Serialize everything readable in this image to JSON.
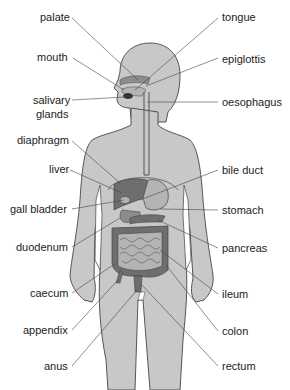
{
  "colors": {
    "body": "#c8c8c8",
    "outline": "#555555",
    "organ_dark": "#6e6e6e",
    "organ_mid": "#8c8c8c",
    "organ_light": "#b4b4b4",
    "leader": "#444444",
    "text": "#222222"
  },
  "labels_left": [
    {
      "id": "palate",
      "text": "palate"
    },
    {
      "id": "mouth",
      "text": "mouth"
    },
    {
      "id": "salivary-glands",
      "text": "salivary",
      "text2": "glands"
    },
    {
      "id": "diaphragm",
      "text": "diaphragm"
    },
    {
      "id": "liver",
      "text": "liver"
    },
    {
      "id": "gall-bladder",
      "text": "gall bladder"
    },
    {
      "id": "duodenum",
      "text": "duodenum"
    },
    {
      "id": "caecum",
      "text": "caecum"
    },
    {
      "id": "appendix",
      "text": "appendix"
    },
    {
      "id": "anus",
      "text": "anus"
    }
  ],
  "labels_right": [
    {
      "id": "tongue",
      "text": "tongue"
    },
    {
      "id": "epiglottis",
      "text": "epiglottis"
    },
    {
      "id": "oesophagus",
      "text": "oesophagus"
    },
    {
      "id": "bile-duct",
      "text": "bile duct"
    },
    {
      "id": "stomach",
      "text": "stomach"
    },
    {
      "id": "pancreas",
      "text": "pancreas"
    },
    {
      "id": "ileum",
      "text": "ileum"
    },
    {
      "id": "colon",
      "text": "colon"
    },
    {
      "id": "rectum",
      "text": "rectum"
    }
  ]
}
